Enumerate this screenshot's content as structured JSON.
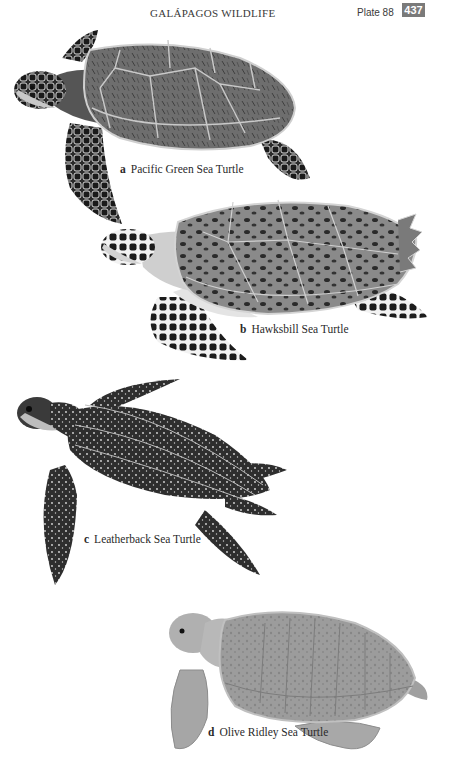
{
  "header": {
    "title": "GALÁPAGOS WILDLIFE",
    "plate": "Plate 88",
    "page_number": "437",
    "badge_color": "#7a7a7a"
  },
  "species": [
    {
      "letter": "a",
      "name": "Pacific Green Sea Turtle",
      "illustration": "green-sea-turtle-illustration"
    },
    {
      "letter": "b",
      "name": "Hawksbill Sea Turtle",
      "illustration": "hawksbill-sea-turtle-illustration"
    },
    {
      "letter": "c",
      "name": "Leatherback Sea Turtle",
      "illustration": "leatherback-sea-turtle-illustration"
    },
    {
      "letter": "d",
      "name": "Olive Ridley Sea Turtle",
      "illustration": "olive-ridley-sea-turtle-illustration"
    }
  ]
}
